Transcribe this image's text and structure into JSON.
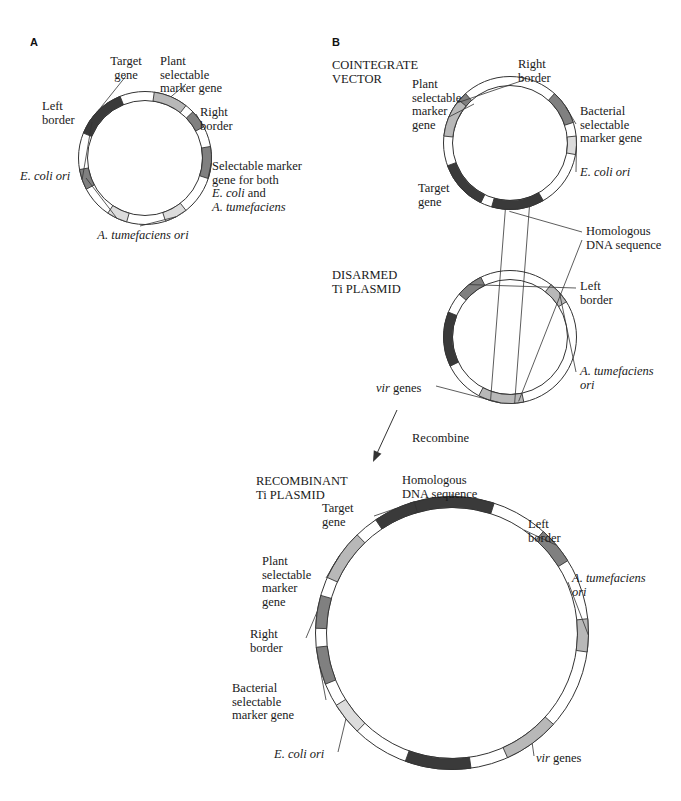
{
  "figure": {
    "panels": [
      {
        "letter": "A"
      },
      {
        "letter": "B"
      }
    ]
  },
  "colors": {
    "dark": "#3a3a3a",
    "medium": "#808080",
    "light": "#b8b8b8",
    "pale": "#dcdcdc",
    "white": "#ffffff",
    "outline": "#333333",
    "text": "#1a1a1a"
  },
  "panel_a": {
    "letter": "A",
    "plasmid": {
      "name": "binary-vector-plasmid",
      "cx": 145,
      "cy": 158,
      "r": 62,
      "band": 9,
      "segments": [
        {
          "name": "target-gene",
          "start": -68,
          "end": -22,
          "shade": "dark"
        },
        {
          "name": "plant-selectable-marker-gene",
          "start": 8,
          "end": 38,
          "shade": "light"
        },
        {
          "name": "right-border",
          "start": 46,
          "end": 62,
          "shade": "medium"
        },
        {
          "name": "selectable-marker-gene-both",
          "start": 80,
          "end": 108,
          "shade": "medium"
        },
        {
          "name": "a-tumefaciens-ori",
          "start": 142,
          "end": 162,
          "shade": "pale"
        },
        {
          "name": "e-coli-ori",
          "start": 196,
          "end": 214,
          "shade": "pale"
        },
        {
          "name": "left-border",
          "start": 242,
          "end": 260,
          "shade": "medium"
        }
      ]
    },
    "labels": [
      {
        "name": "label-target-gene",
        "text": "Target\ngene",
        "x": 96,
        "y": 55,
        "w": 60,
        "align": "center"
      },
      {
        "name": "label-plant-selectable-marker-gene",
        "text": "Plant\nselectable\nmarker gene",
        "x": 160,
        "y": 55,
        "w": 86,
        "align": "left"
      },
      {
        "name": "label-right-border",
        "text": "Right\nborder",
        "x": 200,
        "y": 106,
        "w": 52,
        "align": "left"
      },
      {
        "name": "label-selectable-marker-both",
        "text": "Selectable marker\ngene for both\nE. coli and\nA. tumefaciens",
        "x": 212,
        "y": 160,
        "w": 120,
        "align": "left",
        "italic_lines": [
          2,
          3
        ]
      },
      {
        "name": "label-a-tumefaciens-ori",
        "text": "A. tumefaciens ori",
        "x": 84,
        "y": 229,
        "w": 118,
        "align": "center",
        "italic": true
      },
      {
        "name": "label-e-coli-ori",
        "text": "E. coli ori",
        "x": 20,
        "y": 170,
        "w": 62,
        "align": "left",
        "italic": true
      },
      {
        "name": "label-left-border",
        "text": "Left\nborder",
        "x": 42,
        "y": 100,
        "w": 48,
        "align": "left"
      }
    ]
  },
  "panel_b": {
    "letter": "B",
    "cointegrate": {
      "title": "COINTEGRATE\nVECTOR",
      "title_x": 332,
      "title_y": 58,
      "plasmid": {
        "name": "cointegrate-vector-plasmid",
        "cx": 510,
        "cy": 143,
        "r": 62,
        "band": 9,
        "segments": [
          {
            "name": "right-border",
            "start": -64,
            "end": -42,
            "shade": "medium"
          },
          {
            "name": "bacterial-selectable-marker-gene",
            "start": 42,
            "end": 72,
            "shade": "medium"
          },
          {
            "name": "e-coli-ori",
            "start": 84,
            "end": 100,
            "shade": "pale"
          },
          {
            "name": "homologous-dna-sequence",
            "start": 150,
            "end": 196,
            "shade": "dark"
          },
          {
            "name": "target-gene",
            "start": 206,
            "end": 250,
            "shade": "dark"
          },
          {
            "name": "plant-selectable-marker-gene",
            "start": 276,
            "end": 310,
            "shade": "light"
          }
        ]
      },
      "labels": [
        {
          "name": "label-right-border",
          "text": "Right\nborder",
          "x": 518,
          "y": 58,
          "w": 56,
          "align": "left"
        },
        {
          "name": "label-plant-selectable-marker-gene",
          "text": "Plant\nselectable\nmarker\ngene",
          "x": 412,
          "y": 78,
          "w": 62,
          "align": "left"
        },
        {
          "name": "label-target-gene",
          "text": "Target\ngene",
          "x": 418,
          "y": 182,
          "w": 52,
          "align": "left"
        },
        {
          "name": "label-bacterial-selectable-marker-gene",
          "text": "Bacterial\nselectable\nmarker gene",
          "x": 580,
          "y": 105,
          "w": 90,
          "align": "left"
        },
        {
          "name": "label-e-coli-ori",
          "text": "E. coli ori",
          "x": 580,
          "y": 166,
          "w": 62,
          "align": "left",
          "italic": true
        }
      ]
    },
    "crossover": {
      "name": "homologous-recombination-crossover",
      "label": "Homologous\nDNA sequence",
      "label_x": 586,
      "label_y": 225,
      "label_w": 96
    },
    "disarmed": {
      "title": "DISARMED\nTi PLASMID",
      "title_x": 332,
      "title_y": 268,
      "plasmid": {
        "name": "disarmed-ti-plasmid",
        "cx": 510,
        "cy": 337,
        "r": 62,
        "band": 9,
        "segments": [
          {
            "name": "homologous-dna-sequence",
            "start": -116,
            "end": -68,
            "shade": "dark"
          },
          {
            "name": "left-border",
            "start": -50,
            "end": -26,
            "shade": "medium"
          },
          {
            "name": "a-tumefaciens-ori",
            "start": 38,
            "end": 58,
            "shade": "light"
          },
          {
            "name": "vir-genes",
            "start": 168,
            "end": 208,
            "shade": "light"
          }
        ]
      },
      "labels": [
        {
          "name": "label-left-border",
          "text": "Left\nborder",
          "x": 580,
          "y": 280,
          "w": 52,
          "align": "left"
        },
        {
          "name": "label-a-tumefaciens-ori",
          "text": "A. tumefaciens\nori",
          "x": 580,
          "y": 365,
          "w": 88,
          "align": "left",
          "italic": true
        },
        {
          "name": "label-vir-genes",
          "text": "vir genes",
          "x": 376,
          "y": 382,
          "w": 58,
          "align": "left",
          "mixed_italic_first_word": true
        }
      ]
    },
    "recombine": {
      "name": "recombine-arrow",
      "label": "Recombine",
      "label_x": 412,
      "label_y": 432,
      "arrow": {
        "x1": 397,
        "y1": 410,
        "x2": 373,
        "y2": 462
      }
    },
    "recombinant": {
      "title": "RECOMBINANT\nTi PLASMID",
      "title_x": 256,
      "title_y": 474,
      "plasmid": {
        "name": "recombinant-ti-plasmid",
        "cx": 452,
        "cy": 633,
        "r": 131,
        "band": 11,
        "segments": [
          {
            "name": "homologous-dna-sequence-top",
            "start": -18,
            "end": 18,
            "shade": "dark"
          },
          {
            "name": "left-border",
            "start": 42,
            "end": 58,
            "shade": "medium"
          },
          {
            "name": "a-tumefaciens-ori",
            "start": 84,
            "end": 98,
            "shade": "light"
          },
          {
            "name": "vir-genes",
            "start": 132,
            "end": 156,
            "shade": "light"
          },
          {
            "name": "homologous-dna-sequence-bottom",
            "start": 172,
            "end": 200,
            "shade": "dark"
          },
          {
            "name": "e-coli-ori",
            "start": 224,
            "end": 238,
            "shade": "pale"
          },
          {
            "name": "bacterial-selectable-marker-gene",
            "start": 248,
            "end": 264,
            "shade": "medium"
          },
          {
            "name": "right-border",
            "start": 272,
            "end": 286,
            "shade": "medium"
          },
          {
            "name": "plant-selectable-marker-gene",
            "start": 294,
            "end": 316,
            "shade": "light"
          },
          {
            "name": "target-gene",
            "start": 326,
            "end": 344,
            "shade": "dark"
          }
        ]
      },
      "labels": [
        {
          "name": "label-homologous-dna-sequence",
          "text": "Homologous\nDNA sequence",
          "x": 402,
          "y": 474,
          "w": 100,
          "align": "left"
        },
        {
          "name": "label-target-gene",
          "text": "Target\ngene",
          "x": 322,
          "y": 502,
          "w": 52,
          "align": "left"
        },
        {
          "name": "label-plant-selectable-marker-gene",
          "text": "Plant\nselectable\nmarker\ngene",
          "x": 262,
          "y": 555,
          "w": 62,
          "align": "left"
        },
        {
          "name": "label-right-border",
          "text": "Right\nborder",
          "x": 250,
          "y": 628,
          "w": 54,
          "align": "left"
        },
        {
          "name": "label-bacterial-selectable-marker-gene",
          "text": "Bacterial\nselectable\nmarker gene",
          "x": 232,
          "y": 682,
          "w": 92,
          "align": "left"
        },
        {
          "name": "label-e-coli-ori",
          "text": "E. coli ori",
          "x": 274,
          "y": 748,
          "w": 62,
          "align": "left",
          "italic": true
        },
        {
          "name": "label-left-border",
          "text": "Left\nborder",
          "x": 528,
          "y": 518,
          "w": 52,
          "align": "left"
        },
        {
          "name": "label-a-tumefaciens-ori",
          "text": "A. tumefaciens\nori",
          "x": 572,
          "y": 572,
          "w": 92,
          "align": "left",
          "italic": true
        },
        {
          "name": "label-vir-genes",
          "text": "vir genes",
          "x": 536,
          "y": 752,
          "w": 58,
          "align": "left",
          "mixed_italic_first_word": true
        }
      ]
    }
  }
}
